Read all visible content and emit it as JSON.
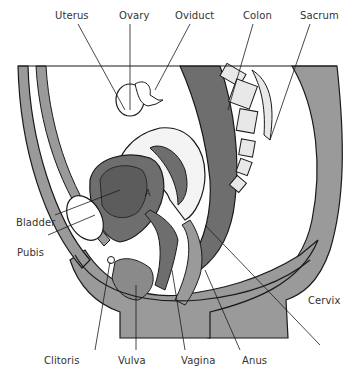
{
  "diagram": {
    "type": "anatomical sagittal section",
    "colors": {
      "tissue_gray": "#9a9a9a",
      "organ_dark": "#6e6e6e",
      "outline": "#1a1a1a",
      "background": "#ffffff",
      "label_text": "#333333"
    },
    "labels": {
      "uterus": "Uterus",
      "ovary": "Ovary",
      "oviduct": "Oviduct",
      "colon": "Colon",
      "sacrum": "Sacrum",
      "bladder": "Bladder",
      "pubis": "Pubis",
      "cervix": "Cervix",
      "clitoris": "Clitoris",
      "vulva": "Vulva",
      "vagina": "Vagina",
      "anus": "Anus",
      "bladder_marker": "A"
    }
  }
}
